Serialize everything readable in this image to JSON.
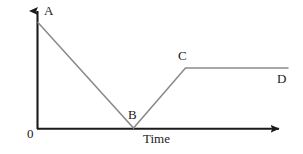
{
  "figure": {
    "background_color": "#ffffff",
    "axis_color": "#1a1a1a",
    "line_color": "#8a8a8a"
  },
  "axes": {
    "y_title": "Speed",
    "x_title": "Time",
    "origin_label": "0"
  },
  "points": {
    "a_label": "A",
    "b_label": "B",
    "c_label": "C",
    "d_label": "D"
  },
  "chart_data": {
    "type": "line",
    "title": "",
    "subtitle": "",
    "xlabel": "Time",
    "ylabel": "Speed",
    "xlim": [
      0,
      100
    ],
    "ylim": [
      0,
      100
    ],
    "grid": false,
    "legend": null,
    "axis_style": "arrow-headed open axes, no tick marks, no numeric scale",
    "annotations": [
      {
        "label": "A",
        "x": 0,
        "y": 100,
        "position": "upper-right of point"
      },
      {
        "label": "B",
        "x": 38,
        "y": 0,
        "position": "upper-left of point"
      },
      {
        "label": "C",
        "x": 59,
        "y": 48,
        "position": "upper-left of point"
      },
      {
        "label": "D",
        "x": 100,
        "y": 48,
        "position": "lower-left of point"
      },
      {
        "label": "0",
        "x": 0,
        "y": 0,
        "position": "lower-left of origin"
      }
    ],
    "series": [
      {
        "name": "speed",
        "x": [
          0,
          38,
          59,
          100
        ],
        "y": [
          100,
          0,
          48,
          48
        ],
        "point_labels": [
          "A",
          "B",
          "C",
          "D"
        ],
        "segments": [
          {
            "from": "A",
            "to": "B",
            "description": "uniform deceleration to zero speed"
          },
          {
            "from": "B",
            "to": "C",
            "description": "uniform acceleration from rest"
          },
          {
            "from": "C",
            "to": "D",
            "description": "constant speed"
          }
        ]
      }
    ]
  },
  "geometry": {
    "y_axis": {
      "x": 37,
      "y_bottom": 129,
      "y_top": 3
    },
    "x_axis": {
      "y": 129,
      "x_left": 37,
      "x_right": 288
    },
    "a": {
      "x": 37,
      "y": 22
    },
    "b": {
      "x": 133,
      "y": 128
    },
    "c": {
      "x": 185,
      "y": 68
    },
    "d": {
      "x": 288,
      "y": 68
    }
  }
}
